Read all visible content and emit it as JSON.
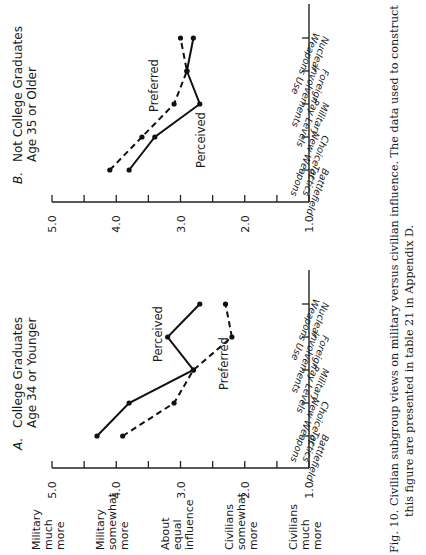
{
  "figure": {
    "caption_line1": "Fig. 10. Civilian subgroup views on military versus civilian influence. The data used to construct",
    "caption_line2": "this figure are presented in table 21 in Appendix D.",
    "orientation": "rotated 90 degrees counter-clockwise"
  },
  "scale_labels": [
    {
      "label_lines": [
        "Military",
        "much",
        "more"
      ],
      "value": 5.0
    },
    {
      "label_lines": [
        "Military",
        "somewhat",
        "more"
      ],
      "value": 4.0
    },
    {
      "label_lines": [
        "About",
        "equal",
        "influence"
      ],
      "value": 3.0
    },
    {
      "label_lines": [
        "Civilians",
        "somewhat",
        "more"
      ],
      "value": 2.0
    },
    {
      "label_lines": [
        "Civilians",
        "much",
        "more"
      ],
      "value": 1.0
    }
  ],
  "chart_data": [
    {
      "type": "line",
      "panel": "A.",
      "title": "College Graduates Age 34 or Younger",
      "title_lines": [
        "College Graduates",
        "Age 34 or Younger"
      ],
      "categories": [
        "Battlefield Tactics",
        "Choice of New Weapons",
        "Military Pay Levels",
        "Foreign Involvements",
        "Nuclear Weapons Use"
      ],
      "category_lines": [
        [
          "Battlefield",
          "Tactics"
        ],
        [
          "Choice of",
          "New Weapons"
        ],
        [
          "Military",
          "Pay Levels"
        ],
        [
          "Foreign",
          "Involvements"
        ],
        [
          "Nuclear",
          "Weapons Use"
        ]
      ],
      "series": [
        {
          "name": "Perceived",
          "style": "solid",
          "values": [
            4.3,
            3.8,
            2.8,
            3.2,
            2.7
          ]
        },
        {
          "name": "Preferred",
          "style": "dashed",
          "values": [
            3.9,
            3.1,
            2.8,
            2.2,
            2.3
          ]
        }
      ],
      "ylabel": "",
      "xlabel": "",
      "ylim": [
        1.0,
        5.0
      ],
      "yticks": [
        "5.0",
        "4.0",
        "3.0",
        "2.0",
        "1.0"
      ],
      "grid": false,
      "legend": "inline labels"
    },
    {
      "type": "line",
      "panel": "B.",
      "title": "Not College Graduates Age 35 or Older",
      "title_lines": [
        "Not College Graduates",
        "Age 35 or Older"
      ],
      "categories": [
        "Battlefield Tactics",
        "Choice of New Weapons",
        "Military Pay Levels",
        "Foreign Involvements",
        "Nuclear Weapons Use"
      ],
      "category_lines": [
        [
          "Battlefield",
          "Tactics"
        ],
        [
          "Choice of",
          "New Weapons"
        ],
        [
          "Military",
          "Pay Levels"
        ],
        [
          "Foreign",
          "Involvements"
        ],
        [
          "Nuclear",
          "Weapons Use"
        ]
      ],
      "series": [
        {
          "name": "Perceived",
          "style": "solid",
          "values": [
            3.8,
            3.4,
            2.7,
            2.9,
            2.8
          ]
        },
        {
          "name": "Preferred",
          "style": "dashed",
          "values": [
            4.1,
            3.6,
            3.1,
            2.9,
            3.0
          ]
        }
      ],
      "ylabel": "",
      "xlabel": "",
      "ylim": [
        1.0,
        5.0
      ],
      "yticks": [
        "5.0",
        "4.0",
        "3.0",
        "2.0",
        "1.0"
      ],
      "grid": false,
      "legend": "inline labels"
    }
  ]
}
